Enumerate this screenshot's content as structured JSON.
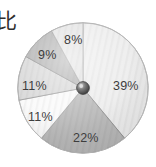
{
  "caption": {
    "text": "比"
  },
  "chart_data": {
    "type": "pie",
    "title": "",
    "subtitle": "",
    "xlabel": "",
    "ylabel": "",
    "grid": false,
    "legend": "none",
    "units": "percent",
    "start_angle_deg": 0,
    "direction": "clockwise",
    "center_hub": true,
    "categories": [
      "39%",
      "22%",
      "11%",
      "11%",
      "9%",
      "8%"
    ],
    "values": [
      39,
      22,
      11,
      11,
      9,
      8
    ],
    "total": 100,
    "slices": [
      {
        "label": "39%",
        "value": 39,
        "color": "#ededed",
        "edge_color": "#9a9a9a",
        "start_deg": 0,
        "end_deg": 140.4,
        "label_color": "#3d3d3d"
      },
      {
        "label": "22%",
        "value": 22,
        "color": "#b7b7b7",
        "edge_color": "#8c8c8c",
        "start_deg": 140.4,
        "end_deg": 219.6,
        "label_color": "#3d3d3d"
      },
      {
        "label": "11%",
        "value": 11,
        "color": "#fafafa",
        "edge_color": "#a5a5a5",
        "start_deg": 219.6,
        "end_deg": 259.2,
        "label_color": "#3d3d3d"
      },
      {
        "label": "11%",
        "value": 11,
        "color": "#d6d6d6",
        "edge_color": "#909090",
        "start_deg": 259.2,
        "end_deg": 298.8,
        "label_color": "#3d3d3d"
      },
      {
        "label": "9%",
        "value": 9,
        "color": "#acacac",
        "edge_color": "#848484",
        "start_deg": 298.8,
        "end_deg": 331.2,
        "label_color": "#3d3d3d"
      },
      {
        "label": "8%",
        "value": 8,
        "color": "#e2e2e2",
        "edge_color": "#9a9a9a",
        "start_deg": 331.2,
        "end_deg": 360,
        "label_color": "#3d3d3d"
      }
    ],
    "colors": {
      "background": "#ffffff",
      "hub_light": "#b0b0b0",
      "hub_dark": "#4a4a4a",
      "text": "#3d3d3d"
    }
  }
}
